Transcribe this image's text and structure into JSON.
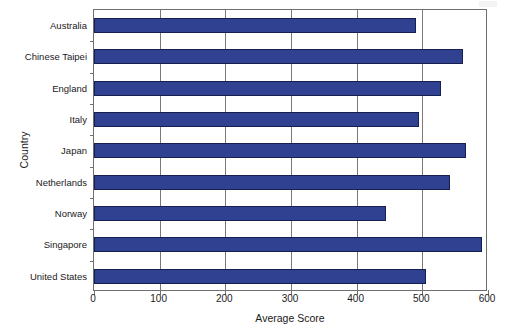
{
  "chart_data": {
    "type": "bar",
    "orientation": "horizontal",
    "title": "",
    "xlabel": "Average Score",
    "ylabel": "Country",
    "categories": [
      "Australia",
      "Chinese Taipei",
      "England",
      "Italy",
      "Japan",
      "Netherlands",
      "Norway",
      "Singapore",
      "United States"
    ],
    "values": [
      490,
      562,
      529,
      495,
      567,
      542,
      445,
      591,
      505
    ],
    "xlim": [
      0,
      600
    ],
    "xticks": [
      0,
      100,
      200,
      300,
      400,
      500,
      600
    ],
    "xtick_labels": [
      "0",
      "100",
      "200",
      "300",
      "400",
      "500",
      "600"
    ],
    "grid": "vertical",
    "legend": "none",
    "series": [
      {
        "name": "Average Score",
        "values": [
          490,
          562,
          529,
          495,
          567,
          542,
          445,
          591,
          505
        ]
      }
    ],
    "colors": {
      "bar_fill": "#2f4190",
      "bar_border": "#16204e",
      "axis": "#6f6f6f",
      "grid": "#7a7a7a",
      "background": "#ffffff",
      "text": "#1a1a1a"
    }
  }
}
